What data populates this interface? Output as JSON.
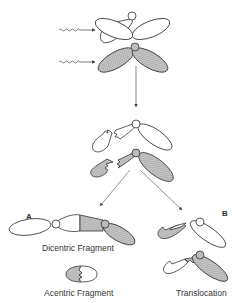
{
  "diagram": {
    "labels": {
      "dicentric": "Dicentric Fragment",
      "acentric": "Acentric Fragment",
      "translocation": "Translocation",
      "path_a": "A",
      "path_b": "B"
    },
    "colors": {
      "stroke": "#333333",
      "shaded": "#bdbdbd",
      "unshaded": "#ffffff",
      "arrow": "#555555"
    },
    "stages": [
      {
        "name": "irradiation",
        "description": "Two chromosomes hit by radiation (wavy arrows)"
      },
      {
        "name": "breakage",
        "description": "Both chromosomes broken (zig-zag breaks)"
      },
      {
        "name": "outcome-a",
        "description": "Dicentric fragment + acentric fragment"
      },
      {
        "name": "outcome-b",
        "description": "Reciprocal translocation"
      }
    ]
  }
}
